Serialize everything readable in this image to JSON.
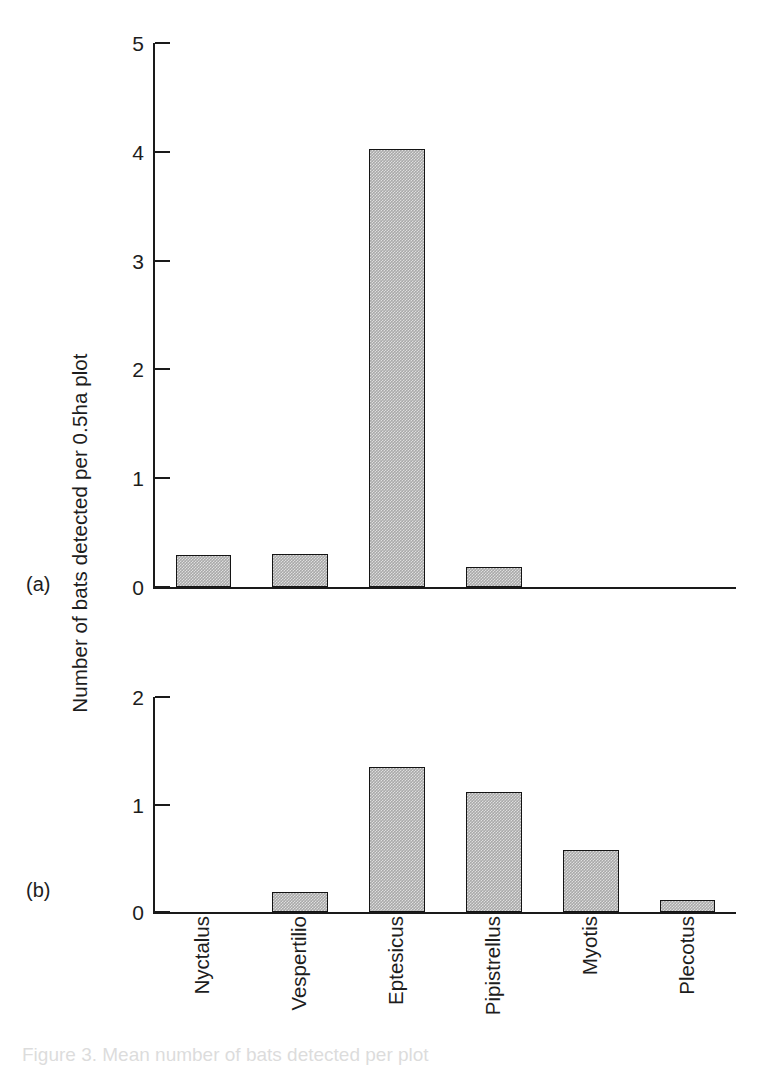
{
  "chart_data": [
    {
      "type": "bar",
      "panel": "(a)",
      "title": "",
      "xlabel": "",
      "ylabel": "Number of bats detected per 0.5ha plot",
      "categories": [
        "Nyctalus",
        "Vespertilio",
        "Eptesicus",
        "Pipistrellus",
        "Myotis",
        "Plecotus"
      ],
      "values": [
        0.29,
        0.3,
        4.03,
        0.18,
        0.0,
        0.0
      ],
      "ylim": [
        0,
        5
      ],
      "yticks": [
        0,
        1,
        2,
        3,
        4,
        5
      ],
      "ytick_labels": [
        "0",
        "1",
        "2",
        "3",
        "4",
        "5"
      ],
      "grid": false,
      "legend": "none",
      "bar_fill": "#a9a9a9",
      "bar_edge": "#141414"
    },
    {
      "type": "bar",
      "panel": "(b)",
      "title": "",
      "xlabel": "",
      "ylabel": "Number of bats detected per 0.5ha plot",
      "categories": [
        "Nyctalus",
        "Vespertilio",
        "Eptesicus",
        "Pipistrellus",
        "Myotis",
        "Plecotus"
      ],
      "values": [
        0.0,
        0.19,
        1.35,
        1.12,
        0.58,
        0.11
      ],
      "ylim": [
        0,
        2
      ],
      "yticks": [
        0,
        1,
        2
      ],
      "ytick_labels": [
        "0",
        "1",
        "2"
      ],
      "grid": false,
      "legend": "none",
      "bar_fill": "#a9a9a9",
      "bar_edge": "#141414"
    }
  ],
  "figure": {
    "shared_ylabel": "Number of bats detected per 0.5ha plot",
    "panel_a_letter": "(a)",
    "panel_b_letter": "(b)",
    "categories": [
      "Nyctalus",
      "Vespertilio",
      "Eptesicus",
      "Pipistrellus",
      "Myotis",
      "Plecotus"
    ],
    "caption_clipped": "Figure 3. Mean number of bats detected per plot",
    "colors": {
      "bar_fill": "#a9a9a9",
      "bar_edge": "#141414",
      "axis": "#1a1a1a",
      "text": "#1d1d1d",
      "background": "#ffffff"
    }
  }
}
